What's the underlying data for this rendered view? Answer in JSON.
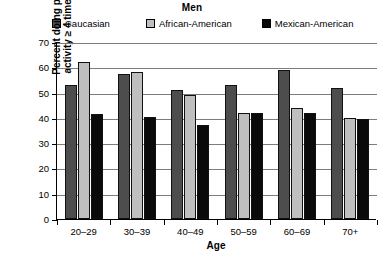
{
  "chart_data": {
    "type": "bar",
    "title": "Men",
    "xlabel": "Age",
    "ylabel": "Percent doing physical\nactivity ≥ 4 times/week",
    "categories": [
      "20–29",
      "30–39",
      "40–49",
      "50–59",
      "60–69",
      "70+"
    ],
    "series": [
      {
        "name": "Caucasian",
        "color": "#4d4d4d",
        "values": [
          53,
          57.5,
          51,
          53,
          59,
          52
        ]
      },
      {
        "name": "African-American",
        "color": "#bfbfbf",
        "values": [
          62,
          58,
          49,
          42,
          44,
          40
        ]
      },
      {
        "name": "Mexican-American",
        "color": "#0a0a0a",
        "values": [
          41.5,
          40.5,
          37,
          42,
          42,
          39.5
        ]
      }
    ],
    "ylim": [
      0,
      70
    ],
    "yticks": [
      0,
      10,
      20,
      30,
      40,
      50,
      60,
      70
    ],
    "grid": true,
    "legend_position": "top"
  }
}
